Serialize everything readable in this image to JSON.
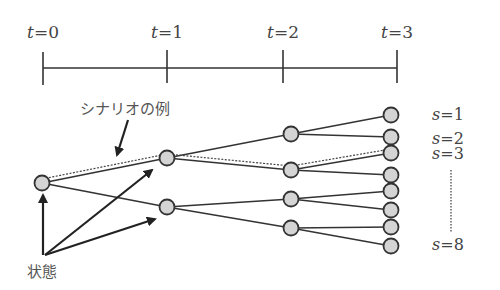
{
  "timeline": {
    "ticks": [
      {
        "label_var": "t",
        "label_eq": "=0",
        "x": 43
      },
      {
        "label_var": "t",
        "label_eq": "=1",
        "x": 167
      },
      {
        "label_var": "t",
        "label_eq": "=2",
        "x": 283
      },
      {
        "label_var": "t",
        "label_eq": "=3",
        "x": 397
      }
    ]
  },
  "scenario_labels": [
    {
      "var": "s",
      "eq": "=1",
      "y": 115
    },
    {
      "var": "s",
      "eq": "=2",
      "y": 140
    },
    {
      "var": "s",
      "eq": "=3",
      "y": 155
    },
    {
      "var": "s",
      "eq": "=8",
      "y": 246
    }
  ],
  "annotations": {
    "scenario_example": "シナリオの例",
    "state": "状態"
  },
  "tree": {
    "node_fill": "#d4d4d4",
    "node_stroke": "#333333",
    "levels": [
      [
        {
          "x": 42,
          "y": 183
        }
      ],
      [
        {
          "x": 167,
          "y": 158
        },
        {
          "x": 167,
          "y": 207
        }
      ],
      [
        {
          "x": 291,
          "y": 134
        },
        {
          "x": 291,
          "y": 170
        },
        {
          "x": 291,
          "y": 199
        },
        {
          "x": 291,
          "y": 228
        }
      ],
      [
        {
          "x": 391,
          "y": 115
        },
        {
          "x": 391,
          "y": 137
        },
        {
          "x": 391,
          "y": 153
        },
        {
          "x": 391,
          "y": 175
        },
        {
          "x": 391,
          "y": 191
        },
        {
          "x": 391,
          "y": 210
        },
        {
          "x": 391,
          "y": 227
        },
        {
          "x": 391,
          "y": 246
        }
      ]
    ],
    "highlighted_scenario": "s=3"
  }
}
